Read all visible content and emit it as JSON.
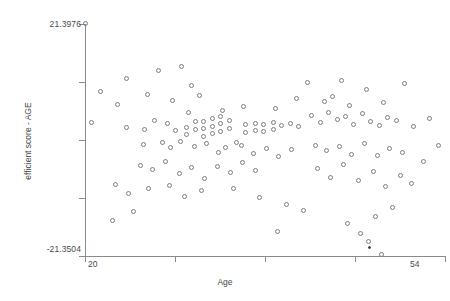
{
  "chart_data": {
    "type": "scatter",
    "title": "",
    "xlabel": "Age",
    "ylabel": "efficient score - AGE",
    "xlim": [
      20,
      54
    ],
    "ylim": [
      -21.3504,
      21.3976
    ],
    "xticklabels": [
      "20",
      "54"
    ],
    "yticklabels": [
      "21.3976",
      "-21.3504"
    ],
    "grid": false,
    "legend": null,
    "marker": "open-circle",
    "n_points": 131,
    "points": [
      {
        "x": 20.0,
        "y": 21.4
      },
      {
        "x": 21.5,
        "y": 8.9
      },
      {
        "x": 20.6,
        "y": 3.2
      },
      {
        "x": 23.9,
        "y": 11.3
      },
      {
        "x": 23.1,
        "y": 6.5
      },
      {
        "x": 23.9,
        "y": 2.3
      },
      {
        "x": 25.5,
        "y": -0.8
      },
      {
        "x": 26.9,
        "y": 12.9
      },
      {
        "x": 29.1,
        "y": 13.6
      },
      {
        "x": 30.1,
        "y": 10.1
      },
      {
        "x": 28.3,
        "y": 7.3
      },
      {
        "x": 30.8,
        "y": 8.2
      },
      {
        "x": 26.6,
        "y": 3.6
      },
      {
        "x": 27.8,
        "y": 3.0
      },
      {
        "x": 25.6,
        "y": 2.0
      },
      {
        "x": 28.5,
        "y": 1.8
      },
      {
        "x": 29.6,
        "y": 2.4
      },
      {
        "x": 29.6,
        "y": 1.1
      },
      {
        "x": 30.4,
        "y": 3.4
      },
      {
        "x": 30.4,
        "y": 1.9
      },
      {
        "x": 31.2,
        "y": 3.4
      },
      {
        "x": 31.2,
        "y": 2.1
      },
      {
        "x": 31.2,
        "y": 0.7
      },
      {
        "x": 32.0,
        "y": 4.0
      },
      {
        "x": 32.0,
        "y": 2.6
      },
      {
        "x": 32.0,
        "y": 1.2
      },
      {
        "x": 32.8,
        "y": 4.3
      },
      {
        "x": 32.8,
        "y": 3.0
      },
      {
        "x": 32.8,
        "y": 1.6
      },
      {
        "x": 33.6,
        "y": 3.6
      },
      {
        "x": 33.6,
        "y": 2.2
      },
      {
        "x": 27.3,
        "y": -0.4
      },
      {
        "x": 28.1,
        "y": -1.4
      },
      {
        "x": 29.0,
        "y": -0.3
      },
      {
        "x": 30.3,
        "y": -1.1
      },
      {
        "x": 31.5,
        "y": -0.6
      },
      {
        "x": 32.6,
        "y": -2.2
      },
      {
        "x": 33.3,
        "y": -1.3
      },
      {
        "x": 34.3,
        "y": -0.4
      },
      {
        "x": 35.2,
        "y": 2.8
      },
      {
        "x": 35.2,
        "y": 1.4
      },
      {
        "x": 36.1,
        "y": 3.1
      },
      {
        "x": 36.1,
        "y": 1.7
      },
      {
        "x": 36.9,
        "y": 2.9
      },
      {
        "x": 36.9,
        "y": 1.5
      },
      {
        "x": 37.8,
        "y": 3.2
      },
      {
        "x": 37.8,
        "y": 1.9
      },
      {
        "x": 38.6,
        "y": 2.7
      },
      {
        "x": 39.4,
        "y": 3.0
      },
      {
        "x": 40.2,
        "y": 2.5
      },
      {
        "x": 34.8,
        "y": -1.0
      },
      {
        "x": 35.9,
        "y": -2.4
      },
      {
        "x": 37.1,
        "y": -1.5
      },
      {
        "x": 38.3,
        "y": -3.1
      },
      {
        "x": 39.5,
        "y": -1.8
      },
      {
        "x": 25.2,
        "y": -4.6
      },
      {
        "x": 26.4,
        "y": -5.4
      },
      {
        "x": 27.6,
        "y": -4.0
      },
      {
        "x": 28.9,
        "y": -6.2
      },
      {
        "x": 30.1,
        "y": -5.0
      },
      {
        "x": 31.3,
        "y": -7.0
      },
      {
        "x": 32.5,
        "y": -4.8
      },
      {
        "x": 33.7,
        "y": -6.0
      },
      {
        "x": 34.9,
        "y": -4.2
      },
      {
        "x": 36.1,
        "y": -5.6
      },
      {
        "x": 22.9,
        "y": -8.1
      },
      {
        "x": 24.1,
        "y": -9.8
      },
      {
        "x": 26.0,
        "y": -9.0
      },
      {
        "x": 28.0,
        "y": -8.4
      },
      {
        "x": 29.4,
        "y": -10.3
      },
      {
        "x": 31.0,
        "y": -9.2
      },
      {
        "x": 22.6,
        "y": -14.9
      },
      {
        "x": 24.6,
        "y": -13.2
      },
      {
        "x": 41.0,
        "y": 10.7
      },
      {
        "x": 42.6,
        "y": 7.2
      },
      {
        "x": 44.2,
        "y": 11.0
      },
      {
        "x": 43.4,
        "y": 8.0
      },
      {
        "x": 45.0,
        "y": 6.4
      },
      {
        "x": 46.6,
        "y": 9.4
      },
      {
        "x": 48.2,
        "y": 6.9
      },
      {
        "x": 50.2,
        "y": 10.4
      },
      {
        "x": 41.4,
        "y": 4.6
      },
      {
        "x": 42.2,
        "y": 3.3
      },
      {
        "x": 43.0,
        "y": 5.0
      },
      {
        "x": 43.8,
        "y": 3.8
      },
      {
        "x": 44.6,
        "y": 4.4
      },
      {
        "x": 45.4,
        "y": 2.9
      },
      {
        "x": 46.2,
        "y": 4.9
      },
      {
        "x": 47.0,
        "y": 3.5
      },
      {
        "x": 47.8,
        "y": 2.7
      },
      {
        "x": 48.6,
        "y": 4.1
      },
      {
        "x": 49.4,
        "y": 3.7
      },
      {
        "x": 51.0,
        "y": 2.6
      },
      {
        "x": 52.5,
        "y": 3.9
      },
      {
        "x": 41.8,
        "y": -0.9
      },
      {
        "x": 42.8,
        "y": -2.0
      },
      {
        "x": 44.0,
        "y": -1.2
      },
      {
        "x": 45.2,
        "y": -2.6
      },
      {
        "x": 46.4,
        "y": -0.7
      },
      {
        "x": 47.6,
        "y": -2.9
      },
      {
        "x": 48.8,
        "y": -1.6
      },
      {
        "x": 50.0,
        "y": -2.2
      },
      {
        "x": 53.4,
        "y": -1.0
      },
      {
        "x": 42.0,
        "y": -5.2
      },
      {
        "x": 43.2,
        "y": -6.8
      },
      {
        "x": 44.4,
        "y": -4.4
      },
      {
        "x": 45.8,
        "y": -7.4
      },
      {
        "x": 47.2,
        "y": -5.8
      },
      {
        "x": 48.4,
        "y": -8.6
      },
      {
        "x": 49.8,
        "y": -6.6
      },
      {
        "x": 39.0,
        "y": -11.9
      },
      {
        "x": 40.6,
        "y": -13.0
      },
      {
        "x": 44.8,
        "y": -15.4
      },
      {
        "x": 38.2,
        "y": -16.8
      },
      {
        "x": 46.0,
        "y": -17.2
      },
      {
        "x": 47.4,
        "y": -14.0
      },
      {
        "x": 49.0,
        "y": -12.4
      },
      {
        "x": 50.8,
        "y": -8.0
      },
      {
        "x": 52.0,
        "y": -4.0
      },
      {
        "x": 33.0,
        "y": 5.4
      },
      {
        "x": 35.0,
        "y": 6.2
      },
      {
        "x": 38.0,
        "y": 5.9
      },
      {
        "x": 40.0,
        "y": 7.6
      },
      {
        "x": 34.0,
        "y": -8.9
      },
      {
        "x": 36.5,
        "y": -10.6
      },
      {
        "x": 25.9,
        "y": 8.4
      },
      {
        "x": 29.8,
        "y": 5.1
      },
      {
        "x": 46.8,
        "y": -18.6
      },
      {
        "x": 48.0,
        "y": -21.0
      },
      {
        "x": 46.9,
        "y": -19.7,
        "filled": true
      }
    ]
  },
  "axes": {
    "y_ticks_count": 5,
    "x_ticks_count": 5,
    "axis_color": "#8a8a8a",
    "marker_color": "#7d7d7d"
  }
}
